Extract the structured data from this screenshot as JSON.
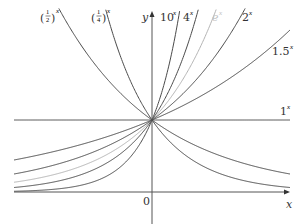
{
  "chart_data": {
    "type": "line",
    "title": "",
    "xlabel": "x",
    "ylabel": "y",
    "origin_label": "0",
    "xlim": [
      -2,
      2
    ],
    "ylim": [
      -0.45,
      2.6
    ],
    "grid": false,
    "legend_position": "inline labels at curve ends",
    "series": [
      {
        "name": "(1/2)^x",
        "base": 0.5,
        "color": "#4a4a4a",
        "label_num": "1",
        "label_den": "2",
        "label_exp": "x"
      },
      {
        "name": "(1/4)^x",
        "base": 0.25,
        "color": "#4a4a4a",
        "label_num": "1",
        "label_den": "4",
        "label_exp": "x"
      },
      {
        "name": "10^x",
        "base": 10,
        "color": "#4a4a4a",
        "label_base": "10",
        "label_exp": "x"
      },
      {
        "name": "4^x",
        "base": 4,
        "color": "#4a4a4a",
        "label_base": "4",
        "label_exp": "x"
      },
      {
        "name": "e^x",
        "base": 2.718281828,
        "color": "#b4b4b4",
        "label_base": "e",
        "label_exp": "x"
      },
      {
        "name": "2^x",
        "base": 2,
        "color": "#4a4a4a",
        "label_base": "2",
        "label_exp": "x"
      },
      {
        "name": "1.5^x",
        "base": 1.5,
        "color": "#4a4a4a",
        "label_base": "1.5",
        "label_exp": "x"
      },
      {
        "name": "1^x",
        "base": 1,
        "color": "#4a4a4a",
        "label_base": "1",
        "label_exp": "x"
      }
    ],
    "annotations": [
      "All curves pass through (0, 1)"
    ]
  },
  "axes": {
    "x_label": "x",
    "y_label": "y",
    "origin": "0"
  },
  "labels": {
    "half": {
      "num": "1",
      "den": "2",
      "exp": "x"
    },
    "quarter": {
      "num": "1",
      "den": "4",
      "exp": "x"
    },
    "ten": {
      "base": "10",
      "exp": "x"
    },
    "four": {
      "base": "4",
      "exp": "x"
    },
    "e": {
      "base": "e",
      "exp": "x"
    },
    "two": {
      "base": "2",
      "exp": "x"
    },
    "onefive": {
      "base": "1.5",
      "exp": "x"
    },
    "one": {
      "base": "1",
      "exp": "x"
    }
  }
}
